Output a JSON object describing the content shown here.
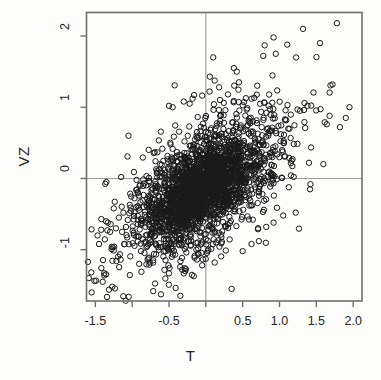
{
  "figure": {
    "background_color": "#fdfdfc",
    "frame_color": "#6e6e6e",
    "point_color": "#1a1a1a",
    "reference_line_color": "#9a9a9a"
  },
  "axes": {
    "x_title": "T",
    "y_title": "VZ"
  },
  "chart_data": {
    "type": "scatter",
    "title": "",
    "xlabel": "T",
    "ylabel": "VZ",
    "xlim": [
      -1.62,
      2.12
    ],
    "ylim": [
      -1.72,
      2.33
    ],
    "xticks": [
      -1.5,
      -1.0,
      -0.5,
      0.0,
      0.5,
      1.0,
      1.5,
      2.0
    ],
    "xticklabels": [
      "-1.5",
      "",
      "-0.5",
      "",
      "0.5",
      "1.0",
      "1.5",
      "2.0"
    ],
    "yticks": [
      -1,
      0,
      1,
      2
    ],
    "yticklabels": [
      "-1",
      "0",
      "1",
      "2"
    ],
    "grid": false,
    "legend": null,
    "marker": "open-circle",
    "marker_size_px": 5.4,
    "reference_lines": [
      {
        "orientation": "vertical",
        "value": 0.0,
        "color": "#9a9a9a"
      },
      {
        "orientation": "horizontal",
        "value": 0.0,
        "color": "#9a9a9a"
      }
    ],
    "n_points": 2600,
    "distribution": {
      "description": "Dense positively-correlated bivariate cloud centred slightly below the origin with a sparse scattering of outliers.",
      "mean_x": -0.04,
      "mean_y": -0.12,
      "sd_x": 0.42,
      "sd_y": 0.42,
      "correlation": 0.62
    },
    "outliers": [
      {
        "x": -1.55,
        "y": -1.6
      },
      {
        "x": -1.4,
        "y": -1.45
      },
      {
        "x": -1.38,
        "y": -1.33
      },
      {
        "x": -1.27,
        "y": -1.52
      },
      {
        "x": -1.45,
        "y": -0.92
      },
      {
        "x": -1.47,
        "y": -0.8
      },
      {
        "x": -1.42,
        "y": -0.72
      },
      {
        "x": -1.33,
        "y": -0.62
      },
      {
        "x": -1.3,
        "y": -0.75
      },
      {
        "x": -1.22,
        "y": -0.7
      },
      {
        "x": -1.18,
        "y": -0.55
      },
      {
        "x": -1.12,
        "y": -0.48
      },
      {
        "x": -1.25,
        "y": -0.42
      },
      {
        "x": -1.35,
        "y": -0.05
      },
      {
        "x": -1.15,
        "y": 0.02
      },
      {
        "x": -1.05,
        "y": 0.6
      },
      {
        "x": -0.88,
        "y": -1.02
      },
      {
        "x": -0.78,
        "y": -1.12
      },
      {
        "x": -0.62,
        "y": 0.2
      },
      {
        "x": -0.5,
        "y": 1.02
      },
      {
        "x": -0.45,
        "y": 1.0
      },
      {
        "x": -0.3,
        "y": 1.08
      },
      {
        "x": -0.22,
        "y": 1.05
      },
      {
        "x": -0.18,
        "y": 1.12
      },
      {
        "x": 0.1,
        "y": 1.7
      },
      {
        "x": 0.05,
        "y": 1.22
      },
      {
        "x": 0.18,
        "y": 1.28
      },
      {
        "x": 0.38,
        "y": 1.55
      },
      {
        "x": 0.42,
        "y": 1.5
      },
      {
        "x": 0.45,
        "y": 1.35
      },
      {
        "x": 0.3,
        "y": 1.18
      },
      {
        "x": 0.62,
        "y": 1.12
      },
      {
        "x": 0.78,
        "y": 1.72
      },
      {
        "x": 0.92,
        "y": 1.98
      },
      {
        "x": 0.95,
        "y": 1.75
      },
      {
        "x": 1.32,
        "y": 2.1
      },
      {
        "x": 1.55,
        "y": 1.9
      },
      {
        "x": 1.78,
        "y": 2.18
      },
      {
        "x": 1.72,
        "y": 1.32
      },
      {
        "x": 1.95,
        "y": 1.0
      },
      {
        "x": 1.9,
        "y": 0.85
      },
      {
        "x": 1.82,
        "y": 0.72
      },
      {
        "x": 1.68,
        "y": 0.88
      },
      {
        "x": 1.38,
        "y": 1.02
      },
      {
        "x": 1.28,
        "y": 0.95
      },
      {
        "x": 1.4,
        "y": 0.22
      },
      {
        "x": 1.42,
        "y": -0.08
      },
      {
        "x": 1.22,
        "y": -0.48
      },
      {
        "x": 1.05,
        "y": -0.52
      },
      {
        "x": 0.92,
        "y": -0.62
      },
      {
        "x": 0.82,
        "y": -0.68
      },
      {
        "x": 0.72,
        "y": -0.88
      },
      {
        "x": 0.62,
        "y": -0.92
      },
      {
        "x": 0.5,
        "y": -1.02
      },
      {
        "x": 0.35,
        "y": -1.55
      },
      {
        "x": 0.12,
        "y": -1.18
      },
      {
        "x": -0.05,
        "y": -1.22
      },
      {
        "x": -0.28,
        "y": -1.3
      },
      {
        "x": -0.32,
        "y": -1.28
      }
    ]
  }
}
